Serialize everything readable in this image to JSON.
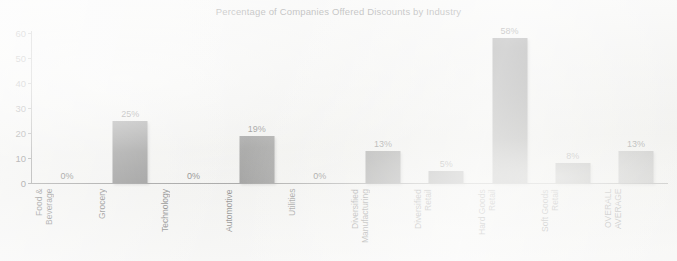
{
  "chart_data": {
    "type": "bar",
    "title": "Percentage of Companies Offered Discounts by Industry",
    "xlabel": "",
    "ylabel": "",
    "ylim": [
      0,
      60
    ],
    "yticks": [
      0,
      10,
      20,
      30,
      40,
      50,
      60
    ],
    "grid": false,
    "legend": null,
    "categories": [
      "Food &\nBeverage",
      "Grocery",
      "Technology",
      "Automotive",
      "Utilities",
      "Diversified\nManufacturing",
      "Diversified\nRetail",
      "Hard Goods\nRetail",
      "Soft Goods\nRetail",
      "OVERALL\nAVERAGE"
    ],
    "values": [
      0,
      25,
      0,
      19,
      0,
      13,
      5,
      58,
      8,
      13
    ],
    "data_labels": [
      "0%",
      "25%",
      "0%",
      "19%",
      "0%",
      "13%",
      "5%",
      "58%",
      "8%",
      "13%"
    ],
    "bar_colors": [
      "#636363",
      "#636363",
      "#636363",
      "#636363",
      "#636363",
      "#636363",
      "#636363",
      "#636363",
      "#636363",
      "#8e8e8e"
    ],
    "highlight_index": 9,
    "colors": {
      "background": "#f1f1ef",
      "bar": "#636363",
      "bar_highlight": "#8e8e8e",
      "axis": "#6f6f6f",
      "text": "#4a4a4a"
    }
  }
}
